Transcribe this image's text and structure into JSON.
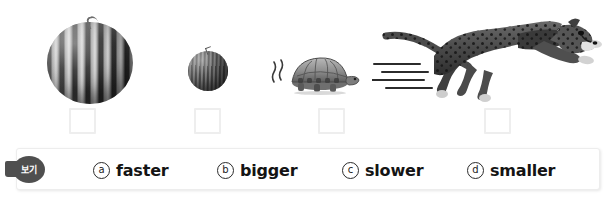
{
  "worksheet": {
    "items": [
      {
        "name": "watermelon",
        "icon": "watermelon-icon",
        "answer_value": "",
        "box_left": 69
      },
      {
        "name": "small-melon",
        "icon": "small-melon-icon",
        "answer_value": "",
        "box_left": 194
      },
      {
        "name": "tortoise",
        "icon": "tortoise-icon",
        "answer_value": "",
        "box_left": 318
      },
      {
        "name": "cheetah",
        "icon": "cheetah-icon",
        "answer_value": "",
        "box_left": 484
      }
    ]
  },
  "choice_bar": {
    "badge_label": "보기",
    "options": [
      {
        "marker": "ⓐ",
        "marker_letter": "a",
        "label": "faster"
      },
      {
        "marker": "ⓑ",
        "marker_letter": "b",
        "label": "bigger"
      },
      {
        "marker": "ⓒ",
        "marker_letter": "c",
        "label": "slower"
      },
      {
        "marker": "ⓓ",
        "marker_letter": "d",
        "label": "smaller"
      }
    ]
  },
  "colors": {
    "badge_background": "#4f4f4f",
    "badge_text": "#ffffff",
    "box_border": "#ededed",
    "answer_box_border": "#eeeeee",
    "text": "#141414",
    "page_background": "#ffffff"
  }
}
